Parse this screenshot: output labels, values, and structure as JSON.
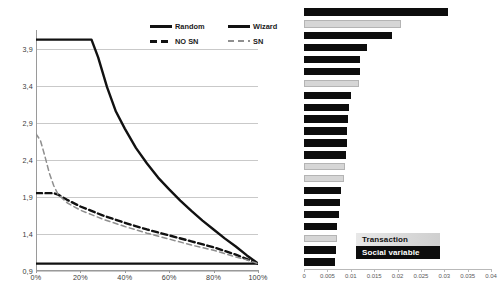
{
  "chart_data": [
    {
      "type": "line",
      "title": "",
      "xlabel": "",
      "ylabel": "",
      "xlim": [
        0,
        100
      ],
      "ylim": [
        0.9,
        4.15
      ],
      "grid": true,
      "legend_position": "top-right",
      "x_tick_labels": [
        "0%",
        "20%",
        "40%",
        "60%",
        "80%",
        "100%"
      ],
      "x_ticks": [
        0,
        20,
        40,
        60,
        80,
        100
      ],
      "y_tick_labels": [
        "3,9",
        "3,4",
        "2,9",
        "2,4",
        "1,9",
        "1,4",
        "0,9"
      ],
      "y_ticks": [
        3.9,
        3.4,
        2.9,
        2.4,
        1.9,
        1.4,
        0.9
      ],
      "legend": [
        {
          "label": "Random",
          "style": "solid",
          "color": "#111111"
        },
        {
          "label": "Wizard",
          "style": "solid",
          "color": "#111111"
        },
        {
          "label": "NO SN",
          "style": "dashed",
          "color": "#111111"
        },
        {
          "label": "SN",
          "style": "dashed",
          "color": "#8f8f8f"
        }
      ],
      "series": [
        {
          "name": "Random",
          "style": "solid",
          "color": "#111111",
          "x": [
            0,
            10,
            20,
            30,
            40,
            50,
            60,
            70,
            80,
            90,
            100
          ],
          "values": [
            1.0,
            1.0,
            1.0,
            1.0,
            1.0,
            1.0,
            1.0,
            1.0,
            1.0,
            1.0,
            1.0
          ]
        },
        {
          "name": "Wizard",
          "style": "solid",
          "color": "#111111",
          "x": [
            0,
            5,
            10,
            15,
            20,
            25,
            28,
            32,
            36,
            40,
            45,
            50,
            55,
            60,
            65,
            70,
            75,
            80,
            85,
            90,
            95,
            100
          ],
          "values": [
            4.02,
            4.02,
            4.02,
            4.02,
            4.02,
            4.02,
            3.78,
            3.38,
            3.05,
            2.82,
            2.56,
            2.35,
            2.16,
            2.0,
            1.85,
            1.71,
            1.58,
            1.46,
            1.34,
            1.23,
            1.11,
            1.0
          ]
        },
        {
          "name": "NO SN",
          "style": "dashed",
          "color": "#111111",
          "x": [
            0,
            4,
            8,
            10,
            14,
            20,
            25,
            30,
            35,
            40,
            50,
            60,
            70,
            80,
            90,
            95,
            100
          ],
          "values": [
            1.95,
            1.95,
            1.95,
            1.93,
            1.86,
            1.77,
            1.71,
            1.65,
            1.6,
            1.55,
            1.46,
            1.38,
            1.3,
            1.22,
            1.12,
            1.06,
            1.0
          ]
        },
        {
          "name": "SN",
          "style": "dashed",
          "color": "#8f8f8f",
          "x": [
            0,
            2,
            4,
            6,
            8,
            10,
            14,
            20,
            25,
            30,
            35,
            40,
            50,
            60,
            70,
            80,
            90,
            95,
            100
          ],
          "values": [
            2.75,
            2.66,
            2.45,
            2.22,
            2.05,
            1.93,
            1.82,
            1.72,
            1.66,
            1.6,
            1.55,
            1.5,
            1.41,
            1.33,
            1.25,
            1.18,
            1.09,
            1.05,
            1.0
          ]
        }
      ]
    },
    {
      "type": "bar",
      "orientation": "horizontal",
      "title": "",
      "xlabel": "",
      "ylabel": "",
      "xlim": [
        0,
        0.04
      ],
      "grid": false,
      "legend_position": "bottom-right",
      "x_tick_labels": [
        "0",
        "0.005",
        "0.01",
        "0.015",
        "0.02",
        "0.025",
        "0.03",
        "0.035",
        "0.04"
      ],
      "x_ticks": [
        0,
        0.005,
        0.01,
        0.015,
        0.02,
        0.025,
        0.03,
        0.035,
        0.04
      ],
      "legend": [
        {
          "label": "Transaction",
          "color": "#d6d6d6"
        },
        {
          "label": "Social variable",
          "color": "#0d0d0d"
        }
      ],
      "categories": [
        "1",
        "2",
        "3",
        "4",
        "5",
        "6",
        "7",
        "8",
        "9",
        "10",
        "11",
        "12",
        "13",
        "14",
        "15",
        "16",
        "17",
        "18",
        "19",
        "20",
        "21"
      ],
      "bars": [
        {
          "value": 0.0308,
          "group": "social"
        },
        {
          "value": 0.0208,
          "group": "transaction"
        },
        {
          "value": 0.0188,
          "group": "social"
        },
        {
          "value": 0.0134,
          "group": "social"
        },
        {
          "value": 0.012,
          "group": "social"
        },
        {
          "value": 0.012,
          "group": "social"
        },
        {
          "value": 0.0118,
          "group": "transaction"
        },
        {
          "value": 0.0101,
          "group": "social"
        },
        {
          "value": 0.0096,
          "group": "social"
        },
        {
          "value": 0.0095,
          "group": "social"
        },
        {
          "value": 0.0093,
          "group": "social"
        },
        {
          "value": 0.0093,
          "group": "social"
        },
        {
          "value": 0.0089,
          "group": "social"
        },
        {
          "value": 0.0087,
          "group": "transaction"
        },
        {
          "value": 0.0086,
          "group": "transaction"
        },
        {
          "value": 0.008,
          "group": "social"
        },
        {
          "value": 0.0078,
          "group": "social"
        },
        {
          "value": 0.0074,
          "group": "social"
        },
        {
          "value": 0.0071,
          "group": "social"
        },
        {
          "value": 0.007,
          "group": "transaction"
        },
        {
          "value": 0.0069,
          "group": "social"
        },
        {
          "value": 0.0067,
          "group": "social"
        }
      ]
    }
  ]
}
